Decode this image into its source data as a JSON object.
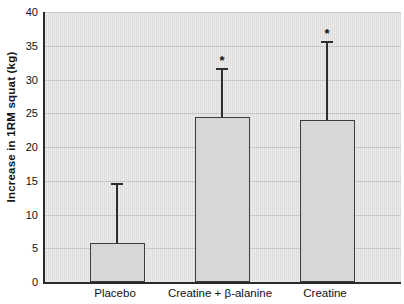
{
  "chart_data": {
    "type": "bar",
    "title": "",
    "xlabel": "",
    "ylabel": "Increase in 1RM squat (kg)",
    "ylim": [
      0,
      40
    ],
    "yticks": [
      0,
      5,
      10,
      15,
      20,
      25,
      30,
      35,
      40
    ],
    "grid": true,
    "legend": "none",
    "categories": [
      "Placebo",
      "Creatine + β-alanine",
      "Creatine"
    ],
    "values": [
      5.8,
      24.5,
      24
    ],
    "error_upper": [
      14.5,
      31.5,
      35.5
    ],
    "significance": [
      "",
      "*",
      "*"
    ],
    "colors": {
      "bar_fill": "#d8d7d5",
      "bar_border": "#3c3c3c",
      "plot_stripe_light": "#ecebe9",
      "plot_stripe_dark": "#dfdedc",
      "gridline": "#c9c8c6",
      "axis": "#2a2a2a",
      "text": "#111111",
      "error_bar": "#2e2e2e"
    }
  }
}
